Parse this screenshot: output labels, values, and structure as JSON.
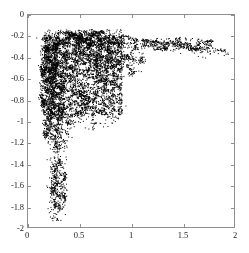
{
  "chart_data": {
    "type": "scatter",
    "title": "",
    "xlabel": "",
    "ylabel": "",
    "xlim": [
      0,
      2
    ],
    "ylim": [
      -2,
      0
    ],
    "grid": false,
    "legend": null,
    "marker": {
      "shape": "point",
      "color": "#000000",
      "size": 1
    },
    "xticks": [
      0,
      0.5,
      1,
      1.5,
      2
    ],
    "xtick_labels": [
      "0",
      "0.5",
      "1",
      "1.5",
      "2"
    ],
    "yticks": [
      0,
      -0.2,
      -0.4,
      -0.6,
      -0.8,
      -1,
      -1.2,
      -1.4,
      -1.6,
      -1.8,
      -2
    ],
    "ytick_labels": [
      "0",
      "-0.2",
      "-0.4",
      "-0.6",
      "-0.8",
      "-1",
      "-1.2",
      "-1.4",
      "-1.6",
      "-1.8",
      "-2"
    ],
    "point_count": 6000,
    "clusters": [
      {
        "name": "main-core",
        "cx": 0.45,
        "cy": -0.5,
        "rx": 0.33,
        "ry": 0.32,
        "weight": 0.3
      },
      {
        "name": "upper-band",
        "cx": 0.55,
        "cy": -0.22,
        "rx": 0.42,
        "ry": 0.08,
        "weight": 0.16
      },
      {
        "name": "left-column",
        "cx": 0.22,
        "cy": -0.62,
        "rx": 0.11,
        "ry": 0.4,
        "weight": 0.16
      },
      {
        "name": "lower-left-lobe",
        "cx": 0.27,
        "cy": -1.02,
        "rx": 0.13,
        "ry": 0.22,
        "weight": 0.1
      },
      {
        "name": "right-arc",
        "cx": 0.9,
        "cy": -0.4,
        "rx": 0.22,
        "ry": 0.18,
        "weight": 0.08
      },
      {
        "name": "right-filament",
        "cx": 1.45,
        "cy": -0.27,
        "rx": 0.45,
        "ry": 0.06,
        "weight": 0.08
      },
      {
        "name": "lower-tail",
        "cx": 0.29,
        "cy": -1.62,
        "rx": 0.08,
        "ry": 0.28,
        "weight": 0.07
      },
      {
        "name": "diagonal-edge",
        "cx": 0.6,
        "cy": -0.85,
        "rx": 0.3,
        "ry": 0.22,
        "weight": 0.05
      }
    ]
  },
  "figure": {
    "background_color": "#ffffff",
    "axes_color": "#8f8f8f",
    "data_color": "#000000"
  }
}
